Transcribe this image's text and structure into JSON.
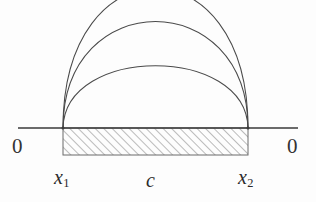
{
  "figure": {
    "background_color": "#fdfdfd",
    "stroke_color": "#4a4a4a",
    "axis_color": "#3a3a3a",
    "hatch_color": "#6b6b6b",
    "text_color": "#2b2b2b"
  },
  "axis": {
    "name": "horizontal-axis",
    "y": 128,
    "x_start": 18,
    "x_end": 298,
    "stroke_width": 1.6
  },
  "interval": {
    "name": "hatched-interval",
    "x_left": 63,
    "x_right": 248,
    "y_top": 128,
    "y_bottom": 155,
    "hatch_angle_deg": 45,
    "hatch_spacing": 6
  },
  "endpoints": [
    {
      "name": "left-endpoint",
      "x": 63,
      "y": 128,
      "label": "x1"
    },
    {
      "name": "right-endpoint",
      "x": 248,
      "y": 128,
      "label": "x2"
    }
  ],
  "arcs": [
    {
      "name": "outer-arc",
      "apex_y": -14,
      "description": "largest arc, clipped by top of figure"
    },
    {
      "name": "middle-arc",
      "apex_y": 42,
      "description": "medium arc"
    },
    {
      "name": "inner-arc",
      "apex_y": 87,
      "description": "smallest arc"
    }
  ],
  "labels": {
    "zero_left": "0",
    "zero_right": "0",
    "x1_base": "x",
    "x1_sub": "1",
    "c": "c",
    "x2_base": "x",
    "x2_sub": "2"
  }
}
